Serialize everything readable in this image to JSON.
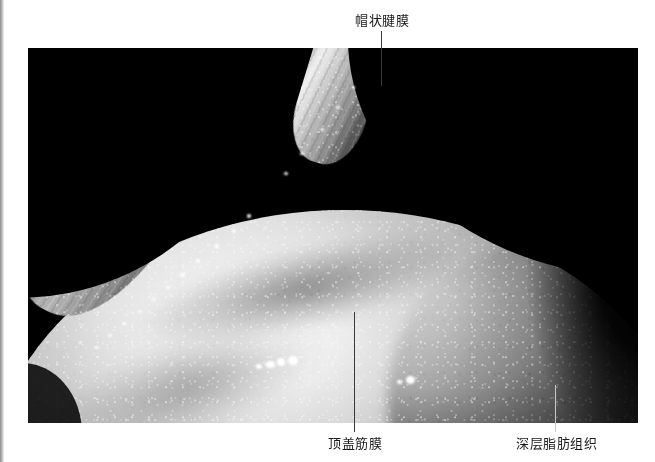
{
  "figure": {
    "background_color": "#ffffff",
    "photo": {
      "name": "anatomical-dissection-photograph",
      "background_color": "#000000",
      "x": 28,
      "y": 48,
      "width": 610,
      "height": 375
    }
  },
  "annotations": [
    {
      "id": "galea",
      "label": "帽状腱膜",
      "label_x": 355,
      "label_y": 14,
      "leader": {
        "x": 381,
        "y_top": 31,
        "y_bottom": 86,
        "color": "#3a3a3a"
      },
      "position": "top"
    },
    {
      "id": "parietal-fascia",
      "label": "顶盖筋膜",
      "label_x": 328,
      "label_y": 437,
      "leader": {
        "x": 354,
        "y_top": 312,
        "y_bottom": 432,
        "color": "#3a3a3a"
      },
      "position": "bottom-left"
    },
    {
      "id": "deep-fat-tissue",
      "label": "深层脂肪组织",
      "label_x": 516,
      "label_y": 437,
      "leader": {
        "x": 555,
        "y_top": 385,
        "y_bottom": 432,
        "color": "#c9c9c9"
      },
      "position": "bottom-right"
    }
  ],
  "specular_highlights": [
    {
      "x": 266,
      "y": 361,
      "w": 9,
      "h": 7
    },
    {
      "x": 277,
      "y": 358,
      "w": 8,
      "h": 8
    },
    {
      "x": 288,
      "y": 356,
      "w": 10,
      "h": 9
    },
    {
      "x": 256,
      "y": 364,
      "w": 6,
      "h": 5
    },
    {
      "x": 406,
      "y": 376,
      "w": 9,
      "h": 8
    },
    {
      "x": 397,
      "y": 380,
      "w": 5,
      "h": 4
    },
    {
      "x": 247,
      "y": 214,
      "w": 4,
      "h": 4
    },
    {
      "x": 232,
      "y": 229,
      "w": 4,
      "h": 4
    },
    {
      "x": 214,
      "y": 244,
      "w": 5,
      "h": 4
    },
    {
      "x": 196,
      "y": 259,
      "w": 4,
      "h": 4
    },
    {
      "x": 180,
      "y": 273,
      "w": 5,
      "h": 4
    },
    {
      "x": 166,
      "y": 286,
      "w": 4,
      "h": 3
    },
    {
      "x": 152,
      "y": 298,
      "w": 4,
      "h": 3
    },
    {
      "x": 138,
      "y": 310,
      "w": 4,
      "h": 3
    },
    {
      "x": 122,
      "y": 322,
      "w": 4,
      "h": 3
    },
    {
      "x": 108,
      "y": 334,
      "w": 4,
      "h": 3
    },
    {
      "x": 95,
      "y": 346,
      "w": 4,
      "h": 3
    },
    {
      "x": 320,
      "y": 128,
      "w": 4,
      "h": 3
    },
    {
      "x": 336,
      "y": 106,
      "w": 4,
      "h": 3
    },
    {
      "x": 352,
      "y": 86,
      "w": 3,
      "h": 3
    },
    {
      "x": 300,
      "y": 152,
      "w": 4,
      "h": 3
    },
    {
      "x": 284,
      "y": 172,
      "w": 4,
      "h": 3
    }
  ]
}
